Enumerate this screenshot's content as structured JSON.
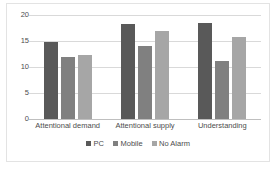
{
  "chart_data": {
    "type": "bar",
    "title": "",
    "subtitle": "",
    "xlabel": "",
    "ylabel": "",
    "categories": [
      "Attentional demand",
      "Attentional supply",
      "Understanding"
    ],
    "series": [
      {
        "name": "PC",
        "color": "#595959",
        "values": [
          14.8,
          18.2,
          18.4
        ]
      },
      {
        "name": "Mobile",
        "color": "#808080",
        "values": [
          11.9,
          14.0,
          11.1
        ]
      },
      {
        "name": "No Alarm",
        "color": "#a6a6a6",
        "values": [
          12.3,
          16.9,
          15.8
        ]
      }
    ],
    "ylim": [
      0,
      20
    ],
    "yticks": [
      0,
      5,
      10,
      15,
      20
    ],
    "ytick_labels": [
      "0",
      "5",
      "10",
      "15",
      "20"
    ],
    "grid": true,
    "grid_axis": "y",
    "grid_color": "#d9d9d9",
    "legend_position": "bottom",
    "plot_background": "#ffffff",
    "border_color": "#e3e3e3",
    "tick_label_color": "#4d4d4d"
  }
}
